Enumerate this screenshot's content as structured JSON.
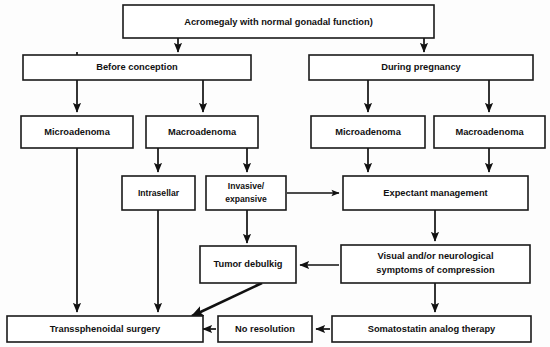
{
  "diagram": {
    "title": "Acromegaly with normal gonadal function)",
    "type": "flowchart",
    "nodes": {
      "root": {
        "label": "Acromegaly with normal gonadal function)"
      },
      "before_conception": {
        "label": "Before conception"
      },
      "during_pregnancy": {
        "label": "During pregnancy"
      },
      "micro_left": {
        "label": "Microadenoma"
      },
      "macro_left": {
        "label": "Macroadenoma"
      },
      "micro_right": {
        "label": "Microadenoma"
      },
      "macro_right": {
        "label": "Macroadenoma"
      },
      "intrasellar": {
        "label": "Intrasellar"
      },
      "invasive": {
        "label_line1": "Invasive/",
        "label_line2": "expansive"
      },
      "expectant": {
        "label": "Expectant management"
      },
      "tumor_debulking": {
        "label": "Tumor debulkig"
      },
      "symptoms": {
        "label_line1": "Visual and/or neurological",
        "label_line2": "symptoms of compression"
      },
      "transsphenoidal": {
        "label": "Transsphenoidal surgery"
      },
      "no_resolution": {
        "label": "No resolution"
      },
      "somatostatin": {
        "label": "Somatostatin analog therapy"
      }
    },
    "edges": [
      {
        "from": "root",
        "to": "before_conception"
      },
      {
        "from": "root",
        "to": "during_pregnancy"
      },
      {
        "from": "before_conception",
        "to": "micro_left"
      },
      {
        "from": "before_conception",
        "to": "macro_left"
      },
      {
        "from": "during_pregnancy",
        "to": "micro_right"
      },
      {
        "from": "during_pregnancy",
        "to": "macro_right"
      },
      {
        "from": "macro_left",
        "to": "intrasellar"
      },
      {
        "from": "macro_left",
        "to": "invasive"
      },
      {
        "from": "micro_right",
        "to": "expectant"
      },
      {
        "from": "macro_right",
        "to": "expectant"
      },
      {
        "from": "invasive",
        "to": "expectant"
      },
      {
        "from": "invasive",
        "to": "tumor_debulking"
      },
      {
        "from": "expectant",
        "to": "symptoms"
      },
      {
        "from": "symptoms",
        "to": "tumor_debulking"
      },
      {
        "from": "symptoms",
        "to": "somatostatin"
      },
      {
        "from": "somatostatin",
        "to": "no_resolution"
      },
      {
        "from": "no_resolution",
        "to": "transsphenoidal"
      },
      {
        "from": "tumor_debulking",
        "to": "transsphenoidal"
      },
      {
        "from": "micro_left",
        "to": "transsphenoidal"
      },
      {
        "from": "intrasellar",
        "to": "transsphenoidal"
      }
    ],
    "colors": {
      "background": "#fdfdfd",
      "box_fill": "#ffffff",
      "box_stroke": "#1a1a1a",
      "text": "#111111",
      "edge": "#111111"
    }
  }
}
